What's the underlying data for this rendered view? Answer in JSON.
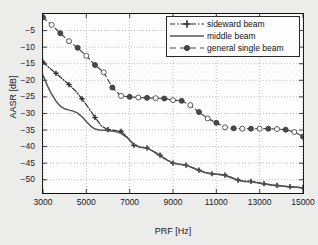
{
  "chart_data": {
    "type": "line",
    "title": "",
    "xlabel": "PRF [Hz]",
    "ylabel": "AASR [dB]",
    "xlim": [
      3000,
      15000
    ],
    "ylim": [
      -54,
      0
    ],
    "xticks": [
      3000,
      5000,
      7000,
      9000,
      11000,
      13000,
      15000
    ],
    "yticks": [
      -5,
      -10,
      -15,
      -20,
      -25,
      -30,
      -35,
      -40,
      -45,
      -50
    ],
    "xtick_labels": [
      "3000",
      "5000",
      "7000",
      "9000",
      "11000",
      "13000",
      "15000"
    ],
    "ytick_labels": [
      "-5",
      "-10",
      "-15",
      "-20",
      "-25",
      "-30",
      "-35",
      "-40",
      "-45",
      "-50"
    ],
    "grid": true,
    "legend_position": "upper right",
    "series": [
      {
        "name": "sideward beam",
        "style": "dash-dot",
        "marker": "plus",
        "color": "#2e2e2e",
        "x": [
          3000,
          3300,
          3600,
          3900,
          4200,
          4500,
          4800,
          5100,
          5400,
          5700,
          6000,
          6300,
          6600,
          6900,
          7200,
          7500,
          7800,
          8100,
          8400,
          8700,
          9000,
          9300,
          9600,
          9900,
          10200,
          10500,
          10800,
          11100,
          11400,
          11700,
          12000,
          12300,
          12600,
          12900,
          13200,
          13500,
          13800,
          14100,
          14400,
          14700,
          15000
        ],
        "y": [
          -14.5,
          -16.3,
          -17.9,
          -19.6,
          -21.3,
          -23.2,
          -25.6,
          -28.3,
          -31.2,
          -33.8,
          -34.9,
          -35.1,
          -35.4,
          -37.2,
          -39.6,
          -40.2,
          -40.4,
          -41.4,
          -42.6,
          -43.9,
          -45.0,
          -45.3,
          -45.6,
          -46.3,
          -47.1,
          -47.8,
          -48.2,
          -48.3,
          -48.6,
          -49.3,
          -50.1,
          -50.4,
          -50.5,
          -50.8,
          -51.2,
          -51.5,
          -51.7,
          -51.9,
          -52.1,
          -52.2,
          -52.4
        ]
      },
      {
        "name": "middle beam",
        "style": "solid",
        "marker": "none",
        "color": "#555555",
        "x": [
          3000,
          3200,
          3400,
          3600,
          3800,
          4000,
          4200,
          4400,
          4600,
          4800,
          5000,
          5200,
          5400,
          5600,
          5800,
          6000,
          6300,
          6600,
          6900,
          7200,
          7500,
          7800,
          8100,
          8400,
          8700,
          9000,
          9300,
          9600,
          9900,
          10200,
          10500,
          10800,
          11100,
          11400,
          11700,
          12000,
          12300,
          12600,
          12900,
          13200,
          13500,
          13800,
          14100,
          14400,
          14700,
          15000
        ],
        "y": [
          -18.5,
          -21.6,
          -24.2,
          -26.3,
          -27.8,
          -28.6,
          -29.0,
          -29.3,
          -29.9,
          -31.0,
          -32.4,
          -33.8,
          -34.7,
          -35.0,
          -35.1,
          -35.2,
          -35.4,
          -36.0,
          -37.4,
          -39.4,
          -40.2,
          -40.4,
          -41.5,
          -42.8,
          -44.0,
          -45.0,
          -45.3,
          -45.6,
          -46.4,
          -47.2,
          -47.9,
          -48.2,
          -48.4,
          -48.7,
          -49.4,
          -50.2,
          -50.5,
          -50.6,
          -50.9,
          -51.3,
          -51.6,
          -51.8,
          -52.0,
          -52.2,
          -52.3,
          -52.5
        ]
      },
      {
        "name": "general single beam",
        "style": "dashed",
        "marker": "circle",
        "color": "#4a4a4a",
        "x": [
          3000,
          3400,
          3800,
          4200,
          4600,
          5000,
          5400,
          5800,
          6200,
          6600,
          7000,
          7400,
          7800,
          8200,
          8600,
          9000,
          9400,
          9800,
          10200,
          10600,
          11000,
          11400,
          11800,
          12200,
          12600,
          13000,
          13400,
          13800,
          14200,
          14600,
          15000
        ],
        "y": [
          -1.0,
          -3.3,
          -5.8,
          -8.2,
          -10.2,
          -12.6,
          -15.4,
          -17.6,
          -22.2,
          -24.7,
          -25.0,
          -25.2,
          -25.3,
          -25.4,
          -25.5,
          -26.0,
          -26.2,
          -27.5,
          -29.6,
          -31.5,
          -32.8,
          -34.2,
          -34.5,
          -34.6,
          -34.6,
          -34.6,
          -34.6,
          -34.7,
          -34.9,
          -35.6,
          -37.0
        ]
      }
    ]
  },
  "legend": {
    "entries": [
      {
        "label": "sideward beam",
        "sample": "dash-dot-plus"
      },
      {
        "label": "middle beam",
        "sample": "solid"
      },
      {
        "label": "general single beam",
        "sample": "dash-circle"
      }
    ]
  },
  "axes": {
    "x_label": "PRF [Hz]",
    "y_label": "AASR [dB]"
  }
}
